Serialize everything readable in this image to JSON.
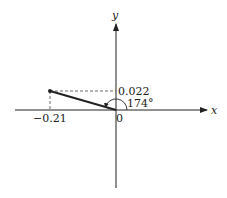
{
  "diagram": {
    "type": "vector-on-axes",
    "x_axis_label": "x",
    "y_axis_label": "y",
    "origin_label": "0",
    "point": {
      "x": -0.21,
      "y": 0.022
    },
    "x_component_label": "−0.21",
    "y_component_label": "0.022",
    "angle_label": "174°",
    "colors": {
      "line": "#222222",
      "background": "#ffffff"
    }
  }
}
